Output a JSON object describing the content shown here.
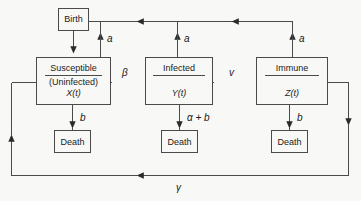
{
  "diagram": {
    "stroke_color": "#4a4a4a",
    "text_color": "#1a1a1a",
    "background_color": "#f8f8f6"
  },
  "boxes": {
    "birth": {
      "label": "Birth"
    },
    "susceptible": {
      "name": "Susceptible",
      "qualifier": "(Uninfected)",
      "variable": "X(t)"
    },
    "infected": {
      "name": "Infected",
      "qualifier": "",
      "variable": "Y(t)"
    },
    "immune": {
      "name": "Immune",
      "qualifier": "",
      "variable": "Z(t)"
    },
    "death_susceptible": {
      "label": "Death"
    },
    "death_infected": {
      "label": "Death"
    },
    "death_immune": {
      "label": "Death"
    }
  },
  "rate_labels": {
    "birth_from_susceptible": "a",
    "birth_from_infected": "a",
    "birth_from_immune": "a",
    "transmission": "β",
    "recovery": "v",
    "death_susceptible": "b",
    "death_infected": "α + b",
    "death_immune": "b",
    "loss_of_immunity": "γ"
  }
}
